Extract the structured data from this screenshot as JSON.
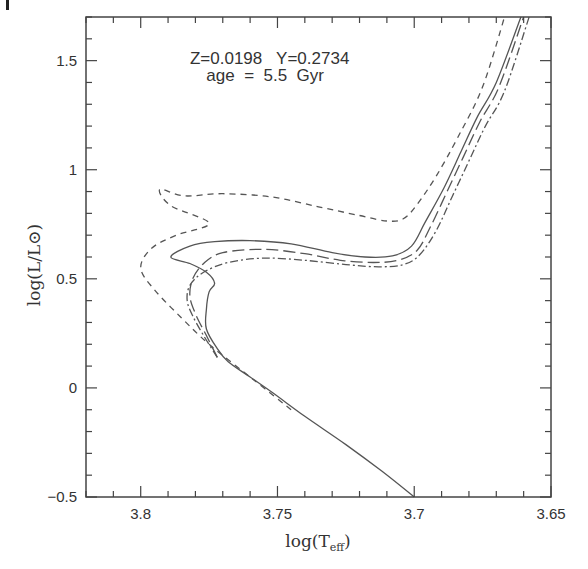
{
  "chart_data": {
    "type": "line",
    "title": "",
    "xlabel": "log(T_eff)",
    "xlabel_main": "log(T",
    "xlabel_sub": "eff",
    "xlabel_close": ")",
    "ylabel": "log(L/L⊙)",
    "xlim": [
      3.82,
      3.65
    ],
    "ylim": [
      -0.5,
      1.7
    ],
    "x_inverted": true,
    "grid": false,
    "legend": null,
    "x_ticks_major": [
      3.8,
      3.75,
      3.7,
      3.65
    ],
    "x_tick_labels": [
      "3.8",
      "3.75",
      "3.7",
      "3.65"
    ],
    "x_minor_step": 0.01,
    "y_ticks_major": [
      -0.5,
      0,
      0.5,
      1,
      1.5
    ],
    "y_tick_labels": [
      "−0.5",
      "0",
      "0.5",
      "1",
      "1.5"
    ],
    "y_minor_step": 0.1,
    "annotations": [
      {
        "text": "Z=0.0198   Y=0.2734",
        "x": 3.782,
        "y": 1.485
      },
      {
        "text": "age  =  5.5  Gyr",
        "x": 3.776,
        "y": 1.405
      }
    ],
    "series": [
      {
        "name": "solid",
        "style": "solid",
        "x": [
          3.7,
          3.712,
          3.725,
          3.74,
          3.752,
          3.76,
          3.768,
          3.772,
          3.776,
          3.776,
          3.775,
          3.773,
          3.776,
          3.782,
          3.789,
          3.782,
          3.773,
          3.76,
          3.745,
          3.73,
          3.718,
          3.708,
          3.701,
          3.696,
          3.689,
          3.683,
          3.677,
          3.67,
          3.661
        ],
        "y": [
          -0.5,
          -0.38,
          -0.26,
          -0.13,
          -0.02,
          0.05,
          0.12,
          0.18,
          0.27,
          0.36,
          0.44,
          0.48,
          0.53,
          0.57,
          0.6,
          0.65,
          0.67,
          0.675,
          0.66,
          0.62,
          0.6,
          0.605,
          0.65,
          0.76,
          0.92,
          1.08,
          1.24,
          1.4,
          1.7
        ]
      },
      {
        "name": "long-dashed",
        "style": "long-dash",
        "x": [
          3.772,
          3.776,
          3.78,
          3.782,
          3.781,
          3.777,
          3.77,
          3.755,
          3.74,
          3.727,
          3.715,
          3.706,
          3.699,
          3.694,
          3.688,
          3.682,
          3.676,
          3.669,
          3.66
        ],
        "y": [
          0.14,
          0.24,
          0.34,
          0.42,
          0.5,
          0.57,
          0.62,
          0.635,
          0.615,
          0.585,
          0.575,
          0.585,
          0.63,
          0.74,
          0.9,
          1.06,
          1.22,
          1.38,
          1.7
        ]
      },
      {
        "name": "dash-dot",
        "style": "dash-dot",
        "x": [
          3.772,
          3.777,
          3.781,
          3.783,
          3.782,
          3.777,
          3.768,
          3.755,
          3.74,
          3.725,
          3.713,
          3.704,
          3.698,
          3.692,
          3.686,
          3.68,
          3.674,
          3.667,
          3.658
        ],
        "y": [
          0.14,
          0.24,
          0.33,
          0.4,
          0.47,
          0.53,
          0.575,
          0.595,
          0.585,
          0.565,
          0.555,
          0.565,
          0.61,
          0.72,
          0.88,
          1.04,
          1.2,
          1.36,
          1.7
        ]
      },
      {
        "name": "short-dashed",
        "style": "short-dash",
        "x": [
          3.745,
          3.76,
          3.775,
          3.785,
          3.795,
          3.8,
          3.796,
          3.787,
          3.775,
          3.789,
          3.793,
          3.784,
          3.77,
          3.752,
          3.735,
          3.72,
          3.71,
          3.704,
          3.699,
          3.692,
          3.684,
          3.675,
          3.667
        ],
        "y": [
          -0.1,
          0.05,
          0.2,
          0.32,
          0.45,
          0.55,
          0.64,
          0.7,
          0.755,
          0.835,
          0.91,
          0.88,
          0.89,
          0.875,
          0.83,
          0.79,
          0.765,
          0.775,
          0.84,
          0.97,
          1.15,
          1.38,
          1.7
        ]
      }
    ],
    "colors": {
      "axis": "#444444",
      "curve": "#555555",
      "text": "#333333"
    }
  }
}
